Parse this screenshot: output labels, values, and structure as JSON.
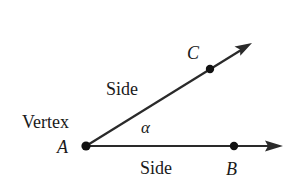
{
  "diagram": {
    "colors": {
      "stroke": "#2a2a2a",
      "text": "#1a1a1a",
      "background": "#ffffff"
    },
    "labels": {
      "vertex": "Vertex",
      "point_a": "A",
      "point_b": "B",
      "point_c": "C",
      "upper_side": "Side",
      "lower_side": "Side",
      "angle": "α"
    },
    "points": {
      "A": {
        "x": 86,
        "y": 146
      },
      "B": {
        "x": 234,
        "y": 146
      },
      "C": {
        "x": 210,
        "y": 69
      }
    },
    "rays": [
      {
        "name": "ray-ab",
        "from": "A",
        "through": "B",
        "tip": {
          "x": 283,
          "y": 146
        }
      },
      {
        "name": "ray-ac",
        "from": "A",
        "through": "C",
        "tip": {
          "x": 252,
          "y": 43
        }
      }
    ]
  }
}
